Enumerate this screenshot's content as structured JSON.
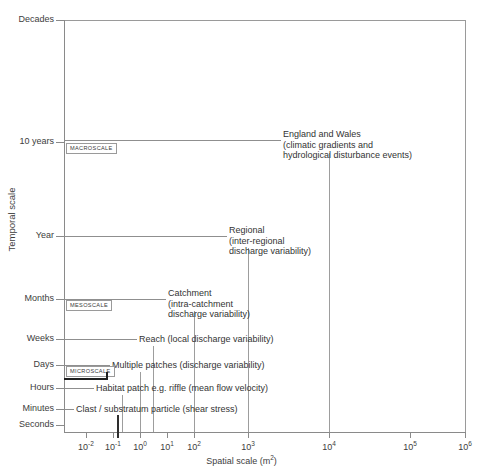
{
  "figure": {
    "y_axis_title": "Temporal scale",
    "x_axis_title_html": "Spatial scale (m²)",
    "x_axis_title": "Spatial scale (m2)"
  },
  "y_axis": {
    "ticks": [
      {
        "label": "Decades",
        "y": 20
      },
      {
        "label": "10  years",
        "y": 142
      },
      {
        "label": "Year",
        "y": 236
      },
      {
        "label": "Months",
        "y": 299
      },
      {
        "label": "Weeks",
        "y": 339
      },
      {
        "label": "Days",
        "y": 365
      },
      {
        "label": "Hours",
        "y": 388
      },
      {
        "label": "Minutes",
        "y": 409
      },
      {
        "label": "Seconds",
        "y": 425
      }
    ]
  },
  "x_axis": {
    "ticks": [
      {
        "mantissa": "10",
        "exponent": "-2",
        "x": 86
      },
      {
        "mantissa": "10",
        "exponent": "-1",
        "x": 113
      },
      {
        "mantissa": "10",
        "exponent": "0",
        "x": 140
      },
      {
        "mantissa": "10",
        "exponent": "1",
        "x": 167
      },
      {
        "mantissa": "10",
        "exponent": "2",
        "x": 194
      },
      {
        "mantissa": "10",
        "exponent": "3",
        "x": 248
      },
      {
        "mantissa": "10",
        "exponent": "4",
        "x": 329
      },
      {
        "mantissa": "10",
        "exponent": "5",
        "x": 410
      },
      {
        "mantissa": "10",
        "exponent": "6",
        "x": 465
      }
    ]
  },
  "scale_boxes": [
    {
      "name": "MACROSCALE",
      "label": "MACROSCALE",
      "x": 66,
      "y": 143
    },
    {
      "name": "MESOSCALE",
      "label": "MESOSCALE",
      "x": 66,
      "y": 300
    },
    {
      "name": "MICROSCALE",
      "label": "MICROSCALE",
      "x": 66,
      "y": 366
    }
  ],
  "entries": [
    {
      "key": "england_wales",
      "lines": [
        "England  and  Wales",
        "(climatic  gradients  and",
        "hydrological  disturbance  events)"
      ],
      "text_x": 283,
      "text_y": 129,
      "hline": {
        "x": 64,
        "y": 140,
        "w": 217
      },
      "vline": {
        "x": 329,
        "y": 153,
        "h": 279
      }
    },
    {
      "key": "regional",
      "lines": [
        "Regional",
        "(inter-regional",
        "discharge  variability)"
      ],
      "text_x": 229,
      "text_y": 225,
      "hline": {
        "x": 64,
        "y": 236,
        "w": 163
      },
      "vline": {
        "x": 248,
        "y": 248,
        "h": 184
      }
    },
    {
      "key": "catchment",
      "lines": [
        "Catchment",
        "(intra-catchment",
        "discharge  variability)"
      ],
      "text_x": 168,
      "text_y": 288,
      "hline": {
        "x": 64,
        "y": 299,
        "w": 102
      },
      "vline": {
        "x": 194,
        "y": 311,
        "h": 121
      }
    },
    {
      "key": "reach",
      "lines": [
        "Reach  (local  discharge  variability)"
      ],
      "text_x": 139,
      "text_y": 334,
      "hline": {
        "x": 64,
        "y": 339,
        "w": 73
      },
      "vline": {
        "x": 153,
        "y": 346,
        "h": 86
      }
    },
    {
      "key": "multiple_patches",
      "lines": [
        "Multiple  patches  (discharge  variability)"
      ],
      "text_x": 112,
      "text_y": 360,
      "hline": {
        "x": 64,
        "y": 365,
        "w": 46
      },
      "vline": {
        "x": 140,
        "y": 372,
        "h": 60
      }
    },
    {
      "key": "habitat_patch",
      "lines": [
        "Habitat  patch  e.g.  riffle  (mean  flow  velocity)"
      ],
      "text_x": 96,
      "text_y": 383,
      "hline": {
        "x": 64,
        "y": 388,
        "w": 30
      },
      "vline": {
        "x": 122,
        "y": 395,
        "h": 37
      }
    },
    {
      "key": "clast",
      "lines": [
        "Clast  /  substratum  particle  (shear  stress)"
      ],
      "text_x": 76,
      "text_y": 404,
      "hline": {
        "x": 64,
        "y": 409,
        "w": 10
      },
      "vline": {
        "x": 117,
        "y": 415,
        "h": 17
      }
    }
  ],
  "micro_bracket": {
    "x": 64,
    "y": 378,
    "w": 42,
    "thickness": 2,
    "stub_h": 6
  }
}
